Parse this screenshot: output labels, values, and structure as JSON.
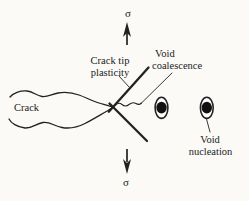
{
  "figure": {
    "colors": {
      "background": "#fbfaf7",
      "ink": "#222222",
      "void_fill": "#111111"
    },
    "labels": {
      "sigma_top": "σ",
      "sigma_bottom": "σ",
      "crack": "Crack",
      "crack_tip_plasticity_line1": "Crack tip",
      "crack_tip_plasticity_line2": "plasticity",
      "void_coalescence_line1": "Void",
      "void_coalescence_line2": "coalescence",
      "void_nucleation_line1": "Void",
      "void_nucleation_line2": "nucleation"
    }
  }
}
